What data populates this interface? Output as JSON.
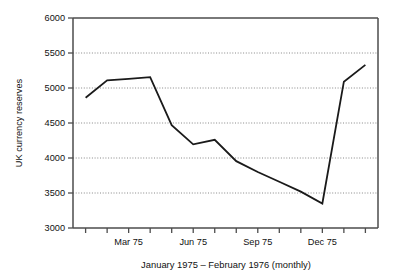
{
  "chart_data": {
    "type": "line",
    "title": "",
    "xlabel": "January 1975 – February 1976 (monthly)",
    "ylabel": "UK currency reserves",
    "ylim": [
      3000,
      6000
    ],
    "ytick_labels": [
      "3000",
      "3500",
      "4000",
      "4500",
      "5000",
      "5500",
      "6000"
    ],
    "ytick_values": [
      3000,
      3500,
      4000,
      4500,
      5000,
      5500,
      6000
    ],
    "xtick_labels": [
      "Mar 75",
      "Jun 75",
      "Sep 75",
      "Dec 75"
    ],
    "xtick_label_indices": [
      2,
      5,
      8,
      11
    ],
    "grid": "horizontal-dotted",
    "legend": "none",
    "x": [
      "Jan 75",
      "Feb 75",
      "Mar 75",
      "Apr 75",
      "May 75",
      "Jun 75",
      "Jul 75",
      "Aug 75",
      "Sep 75",
      "Oct 75",
      "Nov 75",
      "Dec 75",
      "Jan 76",
      "Feb 76"
    ],
    "categories": [
      "Jan 75",
      "Feb 75",
      "Mar 75",
      "Apr 75",
      "May 75",
      "Jun 75",
      "Jul 75",
      "Aug 75",
      "Sep 75",
      "Oct 75",
      "Nov 75",
      "Dec 75",
      "Jan 76",
      "Feb 76"
    ],
    "values": [
      4860,
      5110,
      5130,
      5155,
      4470,
      4195,
      4260,
      3955,
      3800,
      3660,
      3520,
      3350,
      5090,
      5330
    ],
    "series": [
      {
        "name": "UK currency reserves",
        "color": "#1a1a1a",
        "values": [
          4860,
          5110,
          5130,
          5155,
          4470,
          4195,
          4260,
          3955,
          3800,
          3660,
          3520,
          3350,
          5090,
          5330
        ]
      }
    ]
  },
  "figure": {
    "y_axis_title": "UK currency reserves",
    "x_axis_title": "January 1975 – February 1976 (monthly)"
  },
  "colors": {
    "line": "#1a1a1a",
    "axis": "#4d4d4d",
    "grid": "#7a7a7a",
    "background": "#ffffff",
    "text": "#111111"
  }
}
